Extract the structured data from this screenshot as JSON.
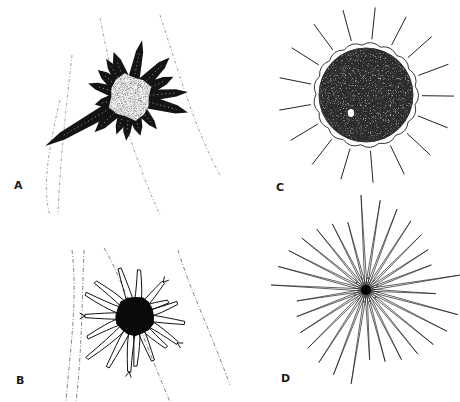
{
  "figure": {
    "background": "#ffffff",
    "ink": "#111111",
    "panels": [
      {
        "id": "A",
        "label": "A",
        "label_pos": [
          14,
          180
        ],
        "description": "cell with speckled pale body and thick dark processes",
        "center": [
          130,
          97
        ],
        "body_radius": 22,
        "body_fill": "#f2f2f2",
        "arm_color": "#141414",
        "arms": [
          {
            "angle": -78,
            "length": 58,
            "width": 6
          },
          {
            "angle": -110,
            "length": 48,
            "width": 7
          },
          {
            "angle": -122,
            "length": 45,
            "width": 6
          },
          {
            "angle": -140,
            "length": 42,
            "width": 7
          },
          {
            "angle": -162,
            "length": 44,
            "width": 6
          },
          {
            "angle": 168,
            "length": 36,
            "width": 7
          },
          {
            "angle": 150,
            "length": 98,
            "width": 7
          },
          {
            "angle": 135,
            "length": 50,
            "width": 7
          },
          {
            "angle": 110,
            "length": 40,
            "width": 6
          },
          {
            "angle": 95,
            "length": 44,
            "width": 6
          },
          {
            "angle": 75,
            "length": 40,
            "width": 7
          },
          {
            "angle": 50,
            "length": 42,
            "width": 6
          },
          {
            "angle": 15,
            "length": 60,
            "width": 7
          },
          {
            "angle": -5,
            "length": 58,
            "width": 6
          },
          {
            "angle": -25,
            "length": 48,
            "width": 7
          },
          {
            "angle": -45,
            "length": 56,
            "width": 7
          }
        ],
        "boundary_lines": [
          "M100 18 C112 80 130 150 160 215",
          "M160 15 C178 70 195 130 220 175",
          "M72 55 C66 110 60 160 58 215",
          "M60 100 C48 150 42 190 50 215"
        ]
      },
      {
        "id": "B",
        "label": "B",
        "label_pos": [
          16,
          375
        ],
        "description": "dark soma with outlined branching processes",
        "center": [
          135,
          316
        ],
        "body_radius": 20,
        "body_fill": "#0a0a0a",
        "process_color": "#111111",
        "processes": [
          {
            "angle": -80,
            "length": 46
          },
          {
            "angle": -50,
            "length": 44
          },
          {
            "angle": -30,
            "length": 36
          },
          {
            "angle": -12,
            "length": 44
          },
          {
            "angle": 8,
            "length": 50
          },
          {
            "angle": 28,
            "length": 50
          },
          {
            "angle": 50,
            "length": 44
          },
          {
            "angle": 68,
            "length": 48
          },
          {
            "angle": 85,
            "length": 50
          },
          {
            "angle": 100,
            "length": 56
          },
          {
            "angle": 118,
            "length": 58
          },
          {
            "angle": 135,
            "length": 64
          },
          {
            "angle": 160,
            "length": 52
          },
          {
            "angle": 180,
            "length": 50
          },
          {
            "angle": -160,
            "length": 54
          },
          {
            "angle": -135,
            "length": 52
          },
          {
            "angle": -108,
            "length": 50
          }
        ],
        "boundary_lines": [
          "M72 250 C78 300 70 350 66 402",
          "M84 250 C82 300 82 350 76 402",
          "M104 248 C118 270 140 330 170 402",
          "M178 250 C190 290 210 330 230 385"
        ]
      },
      {
        "id": "C",
        "label": "C",
        "label_pos": [
          276,
          182
        ],
        "description": "dark speckled disc with radial spines and small pale nucleus",
        "center": [
          366,
          95
        ],
        "disc_radius": 47,
        "disc_fill": "#2b2b2b",
        "nucleus": {
          "x": 351,
          "y": 113,
          "r": 4
        },
        "spine_count": 17,
        "spine_inner": 50,
        "spine_outer": 88,
        "spine_color": "#222222"
      },
      {
        "id": "D",
        "label": "D",
        "label_pos": [
          281,
          373
        ],
        "description": "small dark center with many thin radiating needles",
        "center": [
          366,
          290
        ],
        "core_radius": 5,
        "core_fill": "#050505",
        "needle_count": 30,
        "needle_length_min": 70,
        "needle_length_max": 95,
        "needle_color": "#1c1c1c"
      }
    ]
  }
}
